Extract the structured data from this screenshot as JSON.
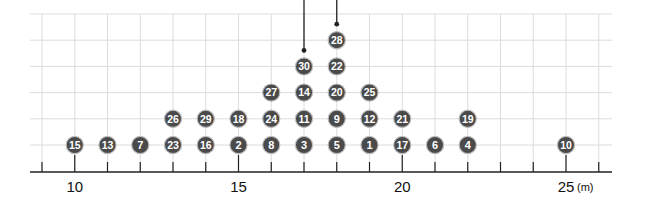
{
  "chart_data": {
    "type": "scatter",
    "subtype": "dot-plot",
    "title": "",
    "xlabel": "",
    "ylabel": "",
    "unit": "(m)",
    "xlim": [
      9,
      26
    ],
    "x_ticks": [
      9,
      10,
      11,
      12,
      13,
      14,
      15,
      16,
      17,
      18,
      19,
      20,
      21,
      22,
      23,
      24,
      25,
      26
    ],
    "x_tick_labels": [
      {
        "value": 10,
        "label": "10"
      },
      {
        "value": 15,
        "label": "15"
      },
      {
        "value": 20,
        "label": "20"
      },
      {
        "value": 25,
        "label": "25"
      }
    ],
    "grid": true,
    "columns": [
      {
        "x": 10,
        "ids": [
          15
        ]
      },
      {
        "x": 11,
        "ids": [
          13
        ]
      },
      {
        "x": 12,
        "ids": [
          7
        ]
      },
      {
        "x": 13,
        "ids": [
          23,
          26
        ]
      },
      {
        "x": 14,
        "ids": [
          16,
          29
        ]
      },
      {
        "x": 15,
        "ids": [
          2,
          18
        ]
      },
      {
        "x": 16,
        "ids": [
          8,
          24,
          27
        ]
      },
      {
        "x": 17,
        "ids": [
          3,
          11,
          14,
          30
        ]
      },
      {
        "x": 18,
        "ids": [
          5,
          9,
          20,
          22,
          28
        ]
      },
      {
        "x": 19,
        "ids": [
          1,
          12,
          25
        ]
      },
      {
        "x": 20,
        "ids": [
          17,
          21
        ]
      },
      {
        "x": 21,
        "ids": [
          6
        ]
      },
      {
        "x": 22,
        "ids": [
          4,
          19
        ]
      },
      {
        "x": 25,
        "ids": [
          10
        ]
      }
    ],
    "pointer_lines": [
      {
        "x": 17,
        "top_of_stack": true
      },
      {
        "x": 18,
        "top_of_stack": true
      }
    ],
    "colors": {
      "dot_fill": "#4a4a4a",
      "dot_stroke": "#bdbdbd",
      "dot_text": "#ffffff",
      "grid": "#dcdcdc",
      "axis": "#222222"
    }
  }
}
